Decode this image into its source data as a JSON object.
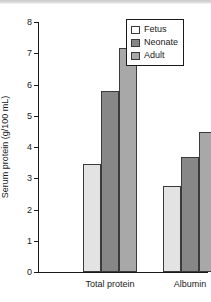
{
  "chart_data": {
    "type": "bar",
    "title": "",
    "xlabel": "",
    "ylabel": "Serum protein (g/100 mL)",
    "categories": [
      "Total protein",
      "Albumin"
    ],
    "series": [
      {
        "name": "Fetus",
        "values": [
          3.45,
          2.75
        ],
        "color": "#e3e3e3"
      },
      {
        "name": "Neonate",
        "values": [
          5.78,
          3.67
        ],
        "color": "#878787"
      },
      {
        "name": "Adult",
        "values": [
          7.17,
          4.47
        ],
        "color": "#a8a8a8"
      }
    ],
    "ylim": [
      0,
      8
    ],
    "ytick_step": 1,
    "yticks": [
      "8",
      "7",
      "6",
      "5",
      "4",
      "3",
      "2",
      "1",
      "0"
    ],
    "grid": false,
    "legend_position": "top-right"
  },
  "legend": {
    "entries": [
      {
        "label": "Fetus",
        "swatch": "fetus"
      },
      {
        "label": "Neonate",
        "swatch": "neonate"
      },
      {
        "label": "Adult",
        "swatch": "adult"
      }
    ]
  },
  "axes": {
    "y_title": "Serum protein (g/100 mL)",
    "category_labels": [
      "Total protein",
      "Albumin"
    ]
  }
}
